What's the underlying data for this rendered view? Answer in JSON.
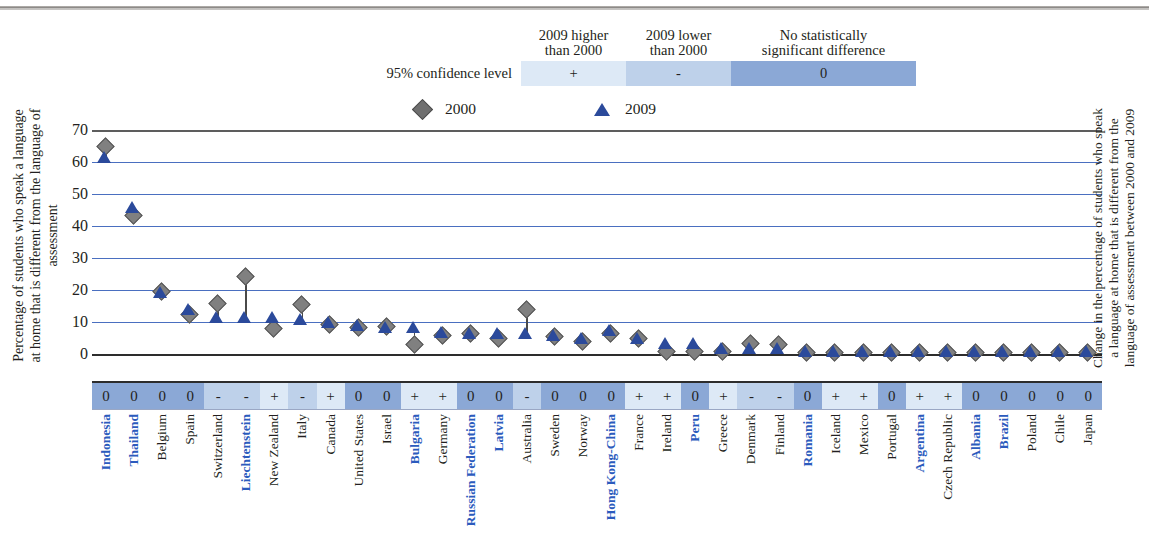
{
  "key": {
    "label": "95% confidence level",
    "headers": [
      "2009 higher\nthan 2000",
      "2009 lower\nthan 2000",
      "No statistically\nsignificant difference"
    ],
    "header_a_line1": "2009 higher",
    "header_a_line2": "than 2000",
    "header_b_line1": "2009 lower",
    "header_b_line2": "than 2000",
    "header_c_line1": "No statistically",
    "header_c_line2": "significant difference",
    "symbols": {
      "higher": "+",
      "lower": "-",
      "nodiff": "0"
    },
    "colors": {
      "higher": "#dde9f6",
      "lower": "#bed1ea",
      "nodiff": "#8ba8d6"
    }
  },
  "series_legend": [
    {
      "name": "2000",
      "marker": "diamond-marker",
      "color": "#808080"
    },
    {
      "name": "2009",
      "marker": "triangle-marker",
      "color": "#2b4a9b"
    }
  ],
  "axis": {
    "y_title": "Percentage of students who speak a language at home that is different from the language of assessment",
    "y_ticks": [
      70,
      60,
      50,
      40,
      30,
      20,
      10,
      0
    ],
    "right_title": "Change in the percentage of students who speak a language at home that is different from the language of assessment between 2000 and 2009"
  },
  "chart_data": {
    "type": "scatter",
    "title": "",
    "xlabel": "",
    "ylabel": "Percentage of students who speak a language at home that is different from the language of assessment",
    "ylim": [
      0,
      70
    ],
    "grid": true,
    "legend_position": "top",
    "categories": [
      "Indonesia",
      "Thailand",
      "Belgium",
      "Spain",
      "Switzerland",
      "Liechtenstein",
      "New Zealand",
      "Italy",
      "Canada",
      "United States",
      "Israel",
      "Bulgaria",
      "Germany",
      "Russian Federation",
      "Latvia",
      "Australia",
      "Sweden",
      "Norway",
      "Hong Kong-China",
      "France",
      "Ireland",
      "Peru",
      "Greece",
      "Denmark",
      "Finland",
      "Romania",
      "Iceland",
      "Mexico",
      "Portugal",
      "Argentina",
      "Czech Republic",
      "Albania",
      "Brazil",
      "Poland",
      "Chile",
      "Japan"
    ],
    "partner_flags": [
      true,
      true,
      false,
      false,
      false,
      true,
      false,
      false,
      false,
      false,
      false,
      true,
      false,
      true,
      true,
      false,
      false,
      false,
      true,
      false,
      false,
      true,
      false,
      false,
      false,
      true,
      false,
      false,
      false,
      true,
      false,
      true,
      true,
      false,
      false,
      false
    ],
    "series": [
      {
        "name": "2000",
        "marker": "diamond",
        "color": "#808080",
        "values": [
          65.0,
          43.5,
          19.8,
          12.5,
          16.0,
          24.5,
          8.0,
          15.5,
          9.5,
          8.5,
          8.8,
          3.0,
          6.0,
          6.5,
          5.0,
          14.0,
          5.5,
          4.0,
          6.5,
          5.0,
          1.0,
          1.0,
          1.0,
          3.5,
          3.0,
          0.5,
          0.5,
          0.5,
          0.5,
          0.5,
          0.5,
          0.5,
          0.5,
          0.5,
          0.5,
          0.5
        ]
      },
      {
        "name": "2009",
        "marker": "triangle",
        "color": "#2b4a9b",
        "values": [
          61.5,
          46.0,
          19.3,
          14.0,
          11.5,
          11.5,
          11.5,
          11.0,
          10.0,
          9.0,
          8.5,
          8.5,
          7.0,
          6.5,
          6.5,
          6.5,
          6.0,
          5.0,
          7.5,
          5.0,
          3.5,
          3.5,
          2.0,
          2.0,
          2.0,
          1.0,
          1.0,
          1.0,
          1.0,
          1.0,
          1.0,
          1.0,
          1.0,
          1.0,
          1.0,
          1.0
        ]
      }
    ],
    "significance": [
      "0",
      "0",
      "0",
      "0",
      "-",
      "-",
      "+",
      "-",
      "+",
      "0",
      "0",
      "+",
      "+",
      "0",
      "0",
      "-",
      "0",
      "0",
      "0",
      "+",
      "+",
      "0",
      "+",
      "-",
      "-",
      "0",
      "+",
      "+",
      "0",
      "+",
      "+",
      "0",
      "0",
      "0",
      "0",
      "0"
    ]
  }
}
